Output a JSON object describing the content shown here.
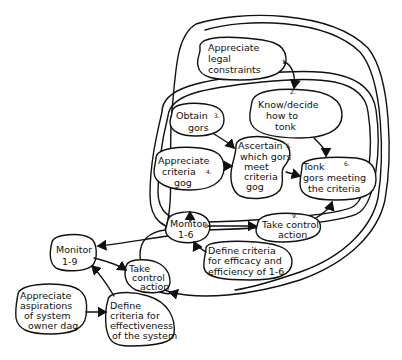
{
  "diagram": {
    "type": "activity-model",
    "nodes": [
      {
        "id": "n1",
        "lines": [
          "Appreciate",
          "legal",
          "constraints"
        ],
        "number": "1."
      },
      {
        "id": "n2",
        "lines": [
          "Know/decide",
          "how to",
          "tonk"
        ],
        "number": "2."
      },
      {
        "id": "n3",
        "lines": [
          "Obtain",
          "gors"
        ],
        "number": "3."
      },
      {
        "id": "n4",
        "lines": [
          "Appreciate",
          "criteria",
          "gog"
        ],
        "number": "4."
      },
      {
        "id": "n5",
        "lines": [
          "Ascertain",
          "which gors",
          "meet",
          "criteria",
          "gog"
        ],
        "number": "5."
      },
      {
        "id": "n6",
        "lines": [
          "Tonk",
          "gors meeting",
          "the criteria"
        ],
        "number": "6."
      },
      {
        "id": "n7",
        "lines": [
          "Define criteria",
          "for efficacy and",
          "efficiency of 1-6"
        ],
        "number": "7."
      },
      {
        "id": "n8",
        "lines": [
          "Monitor",
          "1-6"
        ],
        "number": "8"
      },
      {
        "id": "n9",
        "lines": [
          "Take control",
          "action"
        ],
        "number": "9."
      },
      {
        "id": "n10",
        "lines": [
          "Monitor",
          "1-9"
        ],
        "number": ""
      },
      {
        "id": "n11",
        "lines": [
          "Take",
          "control",
          "action"
        ],
        "number": ""
      },
      {
        "id": "n12",
        "lines": [
          "Appreciate",
          "aspirations",
          "of system",
          "owner dag"
        ],
        "number": ""
      },
      {
        "id": "n13",
        "lines": [
          "Define",
          "criteria for",
          "effectiveness",
          "of the system"
        ],
        "number": ""
      }
    ],
    "edges": [
      {
        "from": "n1",
        "to": "n2"
      },
      {
        "from": "n2",
        "to": "n6"
      },
      {
        "from": "n3",
        "to": "n5"
      },
      {
        "from": "n4",
        "to": "n5"
      },
      {
        "from": "n5",
        "to": "n6"
      },
      {
        "from": "inner-system",
        "to": "n8"
      },
      {
        "from": "n8",
        "to": "n9"
      },
      {
        "from": "n9",
        "to": "inner-system"
      },
      {
        "from": "n7",
        "to": "n8"
      },
      {
        "from": "outer-system",
        "to": "n10"
      },
      {
        "from": "n10",
        "to": "n11"
      },
      {
        "from": "n11",
        "to": "outer-system"
      },
      {
        "from": "n12",
        "to": "n13"
      },
      {
        "from": "n13",
        "to": "n10"
      }
    ]
  }
}
